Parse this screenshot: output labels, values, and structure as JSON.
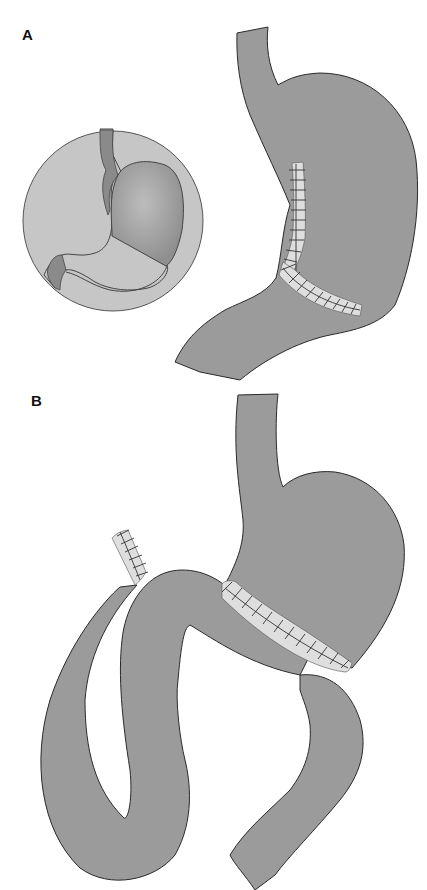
{
  "figure": {
    "panels": [
      {
        "label": "A",
        "description": "Stomach with vertical and oblique staple lines (sleeve/partial gastrectomy); inset circle shows normal stomach anatomy",
        "elements": [
          "esophagus",
          "stomach-body",
          "antrum-duodenum",
          "vertical-staple-line",
          "oblique-staple-line",
          "inset-circle"
        ]
      },
      {
        "label": "B",
        "description": "Gastric remnant with oblique staple line and looping small bowel limb with stapled blind end",
        "elements": [
          "esophagus",
          "gastric-remnant",
          "staple-line",
          "jejunal-loop",
          "stapled-blind-end",
          "efferent-limb"
        ]
      }
    ],
    "colors": {
      "tissue": "#9b9b9b",
      "tissue_outline": "#2a2a2a",
      "inset_background": "#c6c6c6",
      "inset_stomach": "#b0b0b0",
      "inset_dark": "#8a8a8a",
      "staple_band": "#dedede",
      "staple_mark": "#333333",
      "background": "#ffffff"
    }
  }
}
